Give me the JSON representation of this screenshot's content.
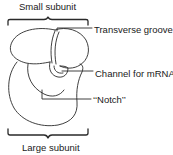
{
  "diagram": {
    "labels": {
      "small_subunit": "Small subunit",
      "large_subunit": "Large subunit",
      "transverse_groove": "Transverse groove",
      "channel_for_mrna": "Channel for mRNA",
      "notch": "‘‘Notch’’"
    },
    "colors": {
      "line": "#2a2a2a",
      "background": "#ffffff"
    }
  }
}
